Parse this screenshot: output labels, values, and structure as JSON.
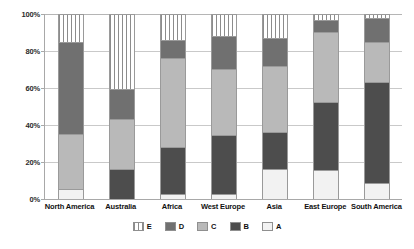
{
  "chart_data": {
    "type": "bar",
    "subtype": "stacked-percentage-column",
    "title": "",
    "xlabel": "",
    "ylabel": "",
    "ylim": [
      0,
      100
    ],
    "yticks": [
      "0%",
      "20%",
      "40%",
      "60%",
      "80%",
      "100%"
    ],
    "ytick_values": [
      0,
      20,
      40,
      60,
      80,
      100
    ],
    "grid": true,
    "legend_position": "bottom",
    "legend_order": [
      "E",
      "D",
      "C",
      "B",
      "A"
    ],
    "categories": [
      "North America",
      "Australia",
      "Africa",
      "West Europe",
      "Asia",
      "East Europe",
      "South America"
    ],
    "series": [
      {
        "name": "A",
        "color": "#f2f2f2",
        "pattern": "solid",
        "values": [
          5,
          0,
          2,
          2,
          16,
          15,
          8
        ]
      },
      {
        "name": "B",
        "color": "#4d4d4d",
        "pattern": "solid",
        "values": [
          0,
          16,
          26,
          32,
          20,
          37,
          55
        ]
      },
      {
        "name": "C",
        "color": "#b9b9b9",
        "pattern": "solid",
        "values": [
          30,
          27,
          48,
          36,
          36,
          38,
          22
        ]
      },
      {
        "name": "D",
        "color": "#707070",
        "pattern": "solid",
        "values": [
          50,
          16,
          10,
          18,
          15,
          7,
          13
        ]
      },
      {
        "name": "E",
        "color": "#ffffff",
        "pattern": "vertical-stripes",
        "values": [
          15,
          41,
          14,
          12,
          13,
          3,
          2
        ]
      }
    ],
    "stack_boundaries": {
      "North America": {
        "A": [
          0,
          5
        ],
        "B": [
          5,
          5
        ],
        "C": [
          5,
          35
        ],
        "D": [
          35,
          85
        ],
        "E": [
          85,
          100
        ]
      },
      "Australia": {
        "A": [
          0,
          0
        ],
        "B": [
          0,
          16
        ],
        "C": [
          16,
          43
        ],
        "D": [
          43,
          59
        ],
        "E": [
          59,
          100
        ]
      },
      "Africa": {
        "A": [
          0,
          2
        ],
        "B": [
          2,
          28
        ],
        "C": [
          28,
          76
        ],
        "D": [
          76,
          86
        ],
        "E": [
          86,
          100
        ]
      },
      "West Europe": {
        "A": [
          0,
          2
        ],
        "B": [
          2,
          34
        ],
        "C": [
          34,
          70
        ],
        "D": [
          70,
          88
        ],
        "E": [
          88,
          100
        ]
      },
      "Asia": {
        "A": [
          0,
          16
        ],
        "B": [
          16,
          36
        ],
        "C": [
          36,
          72
        ],
        "D": [
          72,
          87
        ],
        "E": [
          87,
          100
        ]
      },
      "East Europe": {
        "A": [
          0,
          15
        ],
        "B": [
          15,
          52
        ],
        "C": [
          52,
          90
        ],
        "D": [
          90,
          97
        ],
        "E": [
          97,
          100
        ]
      },
      "South America": {
        "A": [
          0,
          8
        ],
        "B": [
          8,
          63
        ],
        "C": [
          63,
          85
        ],
        "D": [
          85,
          98
        ],
        "E": [
          98,
          100
        ]
      }
    }
  },
  "axis": {
    "yticks": [
      {
        "label": "100%",
        "value": 100
      },
      {
        "label": "80%",
        "value": 80
      },
      {
        "label": "60%",
        "value": 60
      },
      {
        "label": "40%",
        "value": 40
      },
      {
        "label": "20%",
        "value": 20
      },
      {
        "label": "0%",
        "value": 0
      }
    ]
  },
  "legend": {
    "items": [
      {
        "label": "E",
        "color": "#ffffff",
        "pattern": "vertical-stripes"
      },
      {
        "label": "D",
        "color": "#707070",
        "pattern": "solid"
      },
      {
        "label": "C",
        "color": "#b9b9b9",
        "pattern": "solid"
      },
      {
        "label": "B",
        "color": "#4d4d4d",
        "pattern": "solid"
      },
      {
        "label": "A",
        "color": "#f2f2f2",
        "pattern": "solid"
      }
    ]
  }
}
